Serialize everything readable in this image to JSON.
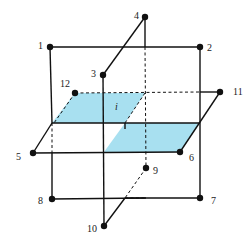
{
  "diagram": {
    "colors": {
      "shade": "#a8e0f0",
      "line": "#111111"
    },
    "plane_label": "i",
    "points": [
      {
        "id": "1",
        "label": "1",
        "x": 50,
        "y": 47
      },
      {
        "id": "2",
        "label": "2",
        "x": 200,
        "y": 47
      },
      {
        "id": "3",
        "label": "3",
        "x": 103,
        "y": 75
      },
      {
        "id": "4",
        "label": "4",
        "x": 145,
        "y": 17
      },
      {
        "id": "5",
        "label": "5",
        "x": 33,
        "y": 153
      },
      {
        "id": "6",
        "label": "6",
        "x": 180,
        "y": 152
      },
      {
        "id": "7",
        "label": "7",
        "x": 200,
        "y": 198
      },
      {
        "id": "8",
        "label": "8",
        "x": 52,
        "y": 199
      },
      {
        "id": "9",
        "label": "9",
        "x": 146,
        "y": 168
      },
      {
        "id": "10",
        "label": "10",
        "x": 104,
        "y": 226
      },
      {
        "id": "11",
        "label": "11",
        "x": 220,
        "y": 92
      },
      {
        "id": "12",
        "label": "12",
        "x": 75,
        "y": 93
      }
    ]
  }
}
